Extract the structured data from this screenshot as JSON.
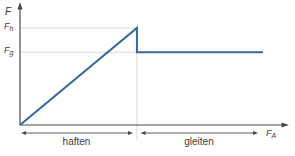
{
  "chart_data": {
    "type": "line",
    "title": "",
    "xlabel": {
      "main": "F",
      "sub": "A"
    },
    "ylabel": {
      "main": "F",
      "sub": ""
    },
    "y_ticks": [
      {
        "main": "F",
        "sub": "h",
        "y": 1.0
      },
      {
        "main": "F",
        "sub": "g",
        "y": 0.75
      }
    ],
    "x_ticks": [],
    "xlim": [
      0,
      1
    ],
    "ylim": [
      0,
      1.15
    ],
    "grid": "partial",
    "legend": "none",
    "series": [
      {
        "name": "friction-force",
        "points": [
          {
            "x": 0,
            "y": 0
          },
          {
            "x": 0.448,
            "y": 1.0
          },
          {
            "x": 0.448,
            "y": 0.75
          },
          {
            "x": 0.931,
            "y": 0.75
          }
        ]
      }
    ],
    "gridlines": {
      "horizontal": [
        {
          "y": 1.0,
          "x_start": 0,
          "x_end": 0.448
        },
        {
          "y": 0.75,
          "x_start": 0,
          "x_end": 0.448
        }
      ],
      "vertical": [
        {
          "x": 0.448,
          "y_top": 1.0,
          "y_bottom": -0.155
        }
      ]
    },
    "regions": [
      {
        "label": "haften",
        "x0": 0.004,
        "x1": 0.433
      },
      {
        "label": "gleiten",
        "x0": 0.462,
        "x1": 0.912
      }
    ],
    "colors": {
      "line": "#32699e",
      "axis": "#4a4a4a",
      "grid": "#d9d9d9",
      "text": "#3a3a3a"
    }
  }
}
